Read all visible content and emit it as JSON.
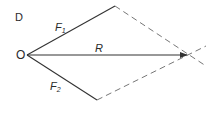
{
  "figure": {
    "panel_label": "D",
    "origin_label": "O",
    "vectors": [
      {
        "name": "F1",
        "label": "F",
        "subscript": "1",
        "from": [
          27,
          55
        ],
        "to": [
          115,
          6
        ]
      },
      {
        "name": "F2",
        "label": "F",
        "subscript": "2",
        "from": [
          27,
          55
        ],
        "to": [
          97,
          100
        ]
      },
      {
        "name": "R",
        "label": "R",
        "from": [
          27,
          55
        ],
        "to": [
          187,
          55
        ]
      }
    ],
    "construction_lines": [
      {
        "from": [
          115,
          6
        ],
        "to": [
          206,
          66
        ],
        "style": "dashed"
      },
      {
        "from": [
          97,
          100
        ],
        "to": [
          206,
          46
        ],
        "style": "dashed"
      }
    ],
    "colors": {
      "line": "#333333",
      "dashed": "#777777",
      "text": "#2a2a2a"
    }
  }
}
